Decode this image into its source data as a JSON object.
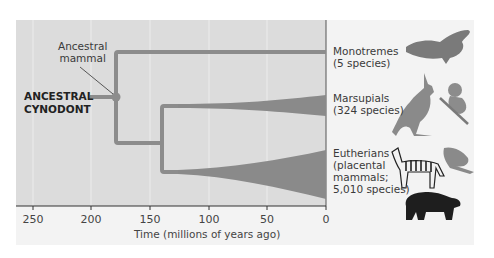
{
  "diagram": {
    "type": "phylogenetic-tree",
    "root_label": [
      "ANCESTRAL",
      "CYNODONT"
    ],
    "node_label": [
      "Ancestral",
      "mammal"
    ],
    "axis": {
      "title": "Time (millions of years ago)",
      "ticks": [
        "250",
        "200",
        "150",
        "100",
        "50",
        "0"
      ]
    },
    "lineages": [
      {
        "name": "Monotremes",
        "lines": [
          "Monotremes",
          "(5 species)"
        ],
        "species": 5,
        "diverged_mya": 180,
        "animals": [
          "platypus"
        ]
      },
      {
        "name": "Marsupials",
        "lines": [
          "Marsupials",
          "(324 species)"
        ],
        "species": 324,
        "diverged_mya": 140,
        "animals": [
          "kangaroo",
          "koala"
        ]
      },
      {
        "name": "Eutherians",
        "lines": [
          "Eutherians",
          "(placental",
          "mammals;",
          "5,010 species)"
        ],
        "species": 5010,
        "diverged_mya": 140,
        "animals": [
          "zebra",
          "mole",
          "bear"
        ]
      }
    ],
    "colors": {
      "panel": "#dcdcdc",
      "backdrop": "#f3f3f3",
      "branch": "#8c8c8c",
      "wedge": "#8a8a8a",
      "gridline": "#ececec"
    }
  }
}
